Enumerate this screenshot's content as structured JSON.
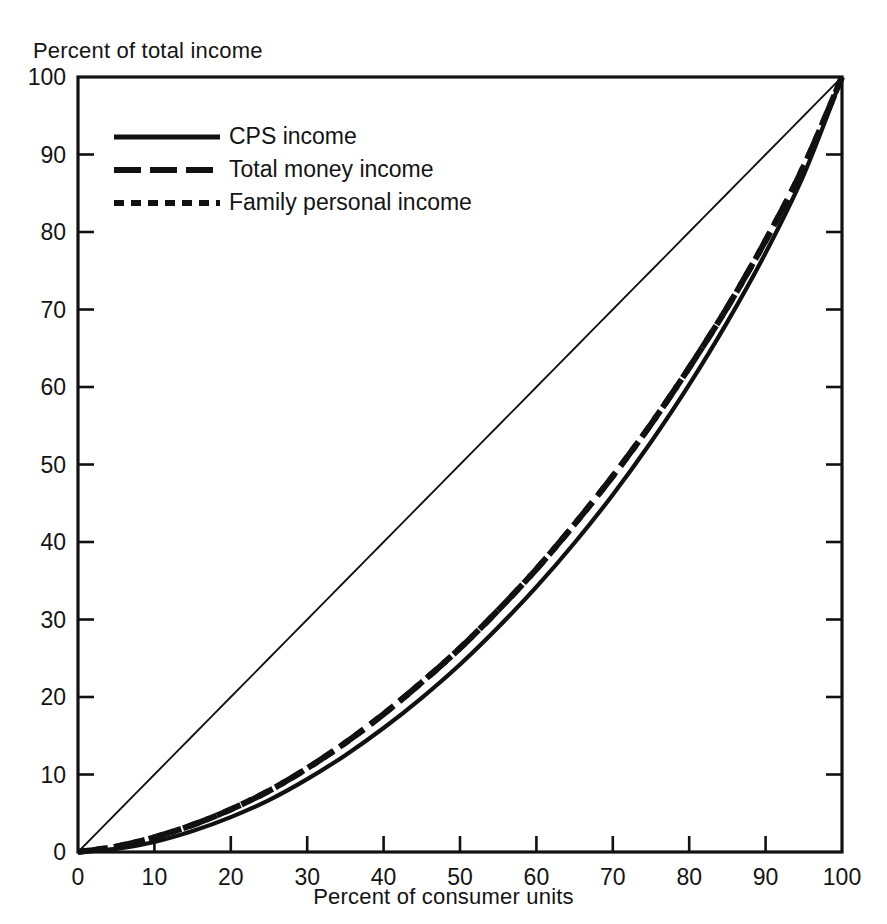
{
  "figure": {
    "background_color": "#ffffff",
    "ink_color": "#111111"
  },
  "axes": {
    "y_title": "Percent of total income",
    "x_title": "Percent of consumer units",
    "x_ticks": [
      "0",
      "10",
      "20",
      "30",
      "40",
      "50",
      "60",
      "70",
      "80",
      "90",
      "100"
    ],
    "y_ticks": [
      "0",
      "10",
      "20",
      "30",
      "40",
      "50",
      "60",
      "70",
      "80",
      "90",
      "100"
    ]
  },
  "legend": {
    "items": [
      {
        "label": "CPS income",
        "style": "solid"
      },
      {
        "label": "Total money income",
        "style": "long-dash"
      },
      {
        "label": "Family personal income",
        "style": "short-dash"
      }
    ]
  },
  "chart_data": {
    "type": "line",
    "title": "",
    "subtitle": "",
    "xlabel": "Percent of consumer units",
    "ylabel": "Percent of total income",
    "xlim": [
      0,
      100
    ],
    "ylim": [
      0,
      100
    ],
    "x_ticks": [
      0,
      10,
      20,
      30,
      40,
      50,
      60,
      70,
      80,
      90,
      100
    ],
    "y_ticks": [
      0,
      10,
      20,
      30,
      40,
      50,
      60,
      70,
      80,
      90,
      100
    ],
    "grid": false,
    "legend_position": "upper-left-inside",
    "annotations": [],
    "x": [
      0,
      5,
      10,
      15,
      20,
      25,
      30,
      35,
      40,
      45,
      50,
      55,
      60,
      65,
      70,
      75,
      80,
      85,
      90,
      95,
      100
    ],
    "series": [
      {
        "name": "CPS income",
        "style": "solid",
        "values": [
          0.0,
          0.4,
          1.3,
          2.7,
          4.5,
          6.7,
          9.4,
          12.5,
          16.0,
          19.9,
          24.2,
          29.0,
          34.2,
          39.9,
          46.1,
          52.9,
          60.3,
          68.4,
          77.3,
          87.4,
          100.0
        ]
      },
      {
        "name": "Total money income",
        "style": "long-dash",
        "values": [
          0.0,
          0.7,
          1.9,
          3.5,
          5.5,
          7.9,
          10.8,
          14.1,
          17.8,
          21.9,
          26.3,
          31.2,
          36.5,
          42.3,
          48.5,
          55.2,
          62.5,
          70.3,
          78.9,
          88.5,
          100.0
        ]
      },
      {
        "name": "Family personal income",
        "style": "short-dash",
        "values": [
          0.0,
          0.7,
          1.9,
          3.5,
          5.5,
          7.9,
          10.8,
          14.1,
          17.8,
          21.9,
          26.3,
          31.2,
          36.5,
          42.3,
          48.5,
          55.2,
          62.5,
          70.3,
          78.9,
          88.5,
          100.0
        ]
      },
      {
        "name": "Line of equality",
        "style": "thin-solid",
        "values": [
          0,
          5,
          10,
          15,
          20,
          25,
          30,
          35,
          40,
          45,
          50,
          55,
          60,
          65,
          70,
          75,
          80,
          85,
          90,
          95,
          100
        ]
      }
    ]
  }
}
